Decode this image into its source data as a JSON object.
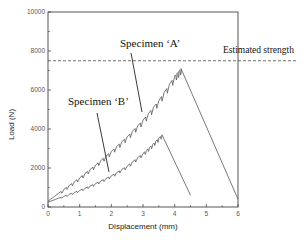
{
  "chart_data": {
    "type": "line",
    "title": "",
    "xlabel": "Displacement (mm)",
    "ylabel": "Load (N)",
    "xlim": [
      0,
      6
    ],
    "ylim": [
      0,
      10000
    ],
    "xticks": [
      0,
      1,
      2,
      3,
      4,
      5,
      6
    ],
    "yticks": [
      0,
      2000,
      4000,
      6000,
      8000,
      10000
    ],
    "grid": false,
    "legend": "none",
    "series": [
      {
        "name": "Specimen 'A'",
        "x": [
          0,
          0.5,
          1.0,
          1.5,
          2.0,
          2.5,
          3.0,
          3.5,
          4.0,
          4.2,
          6.0
        ],
        "y": [
          300,
          900,
          1500,
          2150,
          2850,
          3600,
          4450,
          5450,
          6700,
          7100,
          400
        ]
      },
      {
        "name": "Specimen 'B'",
        "x": [
          0,
          0.5,
          1.0,
          1.5,
          2.0,
          2.5,
          3.0,
          3.3,
          3.6,
          4.5
        ],
        "y": [
          250,
          550,
          850,
          1200,
          1600,
          2100,
          2750,
          3200,
          3700,
          600
        ]
      }
    ],
    "reference_lines": [
      {
        "label": "Estimated strength",
        "y": 7500,
        "style": "dashed"
      }
    ],
    "annotations": [
      {
        "text": "Specimen 'A'",
        "points_to_series": "Specimen 'A'"
      },
      {
        "text": "Specimen 'B'",
        "points_to_series": "Specimen 'B'"
      },
      {
        "text": "Estimated strength"
      }
    ]
  },
  "labels": {
    "xlabel": "Displacement (mm)",
    "ylabel": "Load (N)",
    "specimen_a": "Specimen ‘A’",
    "specimen_b": "Specimen ‘B’",
    "estimated_strength": "Estimated strength",
    "xticks": [
      "0",
      "1",
      "2",
      "3",
      "4",
      "5",
      "6"
    ],
    "yticks": [
      "0",
      "2000",
      "4000",
      "6000",
      "8000",
      "10000"
    ]
  }
}
